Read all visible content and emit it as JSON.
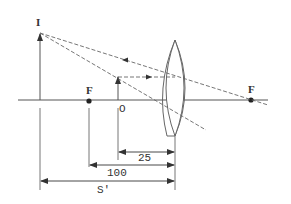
{
  "diagram": {
    "type": "optics-ray-diagram",
    "labels": {
      "image": "I",
      "object": "O",
      "focal_left": "F",
      "focal_right": "F"
    },
    "dimensions": {
      "object_distance": "25",
      "focal_length": "100",
      "image_distance": "S'"
    },
    "colors": {
      "line": "#555555",
      "dash": "#666666",
      "dot": "#222222"
    }
  }
}
